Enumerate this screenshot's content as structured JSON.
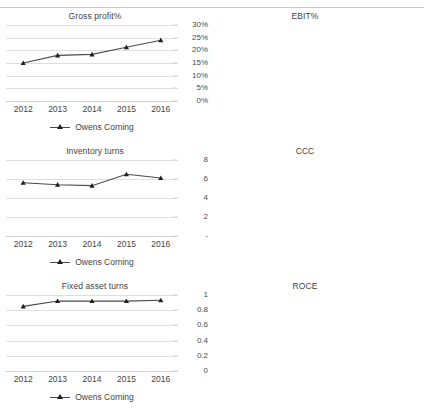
{
  "header": {
    "cutoff_text": "Figure — Owens Corning ratio analysis",
    "visible": false
  },
  "series_name": "Owens Corning",
  "categories": [
    "2012",
    "2013",
    "2014",
    "2015",
    "2016"
  ],
  "colors": {
    "line": "#4a4a4a",
    "marker": "#1f1f1f",
    "gridline": "#dedede",
    "text": "#3f3f3f",
    "background": "#ffffff"
  },
  "chart_data": [
    {
      "type": "line",
      "title": "Gross profit%",
      "xlabel": "",
      "ylabel": "",
      "categories": [
        "2012",
        "2013",
        "2014",
        "2015",
        "2016"
      ],
      "series": [
        {
          "name": "Owens Corning",
          "values": [
            15.0,
            18.0,
            18.4,
            21.2,
            24.0
          ]
        }
      ],
      "ylim": [
        0,
        30
      ],
      "yticks": [
        0,
        5,
        10,
        15,
        20,
        25,
        30
      ],
      "yticklabels": [
        "0%",
        "5%",
        "10%",
        "15%",
        "20%",
        "25%",
        "30%"
      ],
      "grid": true,
      "legend_position": "bottom"
    },
    {
      "type": "line",
      "title": "EBIT%",
      "xlabel": "",
      "ylabel": "",
      "categories": [
        "2012",
        "2013",
        "2014",
        "2015",
        "2016"
      ],
      "series": [
        {
          "name": "Owens Corning",
          "values": [
            2.5,
            7.0,
            7.2,
            10.0,
            12.1
          ]
        }
      ],
      "ylim": [
        0,
        15
      ],
      "yticks": [
        0,
        5,
        10,
        15
      ],
      "yticklabels": [
        "0%",
        "5%",
        "10%",
        "15%"
      ],
      "grid": true,
      "legend_position": "bottom"
    },
    {
      "type": "line",
      "title": "Inventory turns",
      "xlabel": "",
      "ylabel": "",
      "categories": [
        "2012",
        "2013",
        "2014",
        "2015",
        "2016"
      ],
      "series": [
        {
          "name": "Owens Corning",
          "values": [
            5.6,
            5.4,
            5.3,
            6.5,
            6.1
          ]
        }
      ],
      "ylim": [
        0,
        8
      ],
      "yticks": [
        0,
        2,
        4,
        6,
        8
      ],
      "yticklabels": [
        "-",
        "2",
        "4",
        "6",
        "8"
      ],
      "grid": true,
      "legend_position": "bottom"
    },
    {
      "type": "line",
      "title": "CCC",
      "xlabel": "",
      "ylabel": "",
      "categories": [
        "2012",
        "2013",
        "2014",
        "2015",
        "2016"
      ],
      "series": [
        {
          "name": "Owens Corning",
          "values": [
            33.0,
            32.0,
            35.0,
            21.5,
            22.0
          ]
        }
      ],
      "ylim": [
        0,
        40
      ],
      "yticks": [
        0,
        10,
        20,
        30,
        40
      ],
      "yticklabels": [
        "-",
        "10",
        "20",
        "30",
        "40"
      ],
      "grid": true,
      "legend_position": "bottom"
    },
    {
      "type": "line",
      "title": "Fixed asset turns",
      "xlabel": "",
      "ylabel": "",
      "categories": [
        "2012",
        "2013",
        "2014",
        "2015",
        "2016"
      ],
      "series": [
        {
          "name": "Owens Corning",
          "values": [
            0.85,
            0.92,
            0.92,
            0.92,
            0.93
          ]
        }
      ],
      "ylim": [
        0,
        1
      ],
      "yticks": [
        0,
        0.2,
        0.4,
        0.6,
        0.8,
        1
      ],
      "yticklabels": [
        "0",
        "0.2",
        "0.4",
        "0.6",
        "0.8",
        "1"
      ],
      "grid": true,
      "legend_position": "bottom"
    },
    {
      "type": "line",
      "title": "ROCE",
      "xlabel": "",
      "ylabel": "",
      "categories": [
        "2012",
        "2013",
        "2014",
        "2015",
        "2016"
      ],
      "series": [
        {
          "name": "Owens Corning",
          "values": [
            2.0,
            5.7,
            5.9,
            8.6,
            10.3
          ]
        }
      ],
      "ylim": [
        0,
        12
      ],
      "yticks": [
        0,
        2,
        4,
        6,
        8,
        10,
        12
      ],
      "yticklabels": [
        "0%",
        "2%",
        "4%",
        "6%",
        "8%",
        "10%",
        "12%"
      ],
      "grid": true,
      "legend_position": "bottom"
    }
  ]
}
